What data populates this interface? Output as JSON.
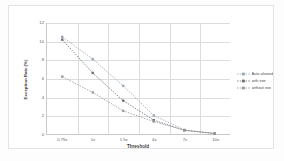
{
  "chart_data": {
    "type": "line",
    "title": "",
    "xlabel": "Threshold",
    "ylabel": "Exception Rate (%)",
    "categories": [
      "0.75x",
      "1x",
      "1.5x",
      "4x",
      "7x",
      "10x"
    ],
    "ylim": [
      0,
      12
    ],
    "yticks": [
      0,
      2,
      4,
      6,
      8,
      10,
      12
    ],
    "grid": true,
    "legend_position": "right",
    "series": [
      {
        "name": "Auto aligned",
        "color": "#9aa7b8",
        "marker": "square",
        "linestyle": "dotted",
        "values": [
          10.5,
          8.1,
          5.2,
          2.0,
          0.45,
          0.05
        ]
      },
      {
        "name": "with eye",
        "color": "#6f6f6f",
        "marker": "square",
        "linestyle": "dotted",
        "values": [
          10.2,
          6.6,
          3.6,
          1.5,
          0.4,
          0.05
        ]
      },
      {
        "name": "without eye",
        "color": "#9a9a9a",
        "marker": "square",
        "linestyle": "dotted",
        "values": [
          6.2,
          4.5,
          2.5,
          1.35,
          0.4,
          0.05
        ]
      }
    ]
  },
  "axes": {
    "y_tick_labels": [
      "12",
      "10",
      "8",
      "6",
      "4",
      "2",
      "0"
    ],
    "x_tick_labels": [
      "0.75x",
      "1x",
      "1.5x",
      "4x",
      "7x",
      "10x"
    ],
    "x_title": "Threshold",
    "y_title": "Exception Rate (%)"
  },
  "legend": {
    "items": [
      {
        "label": "Auto aligned",
        "color": "#9aa7b8"
      },
      {
        "label": "with eye",
        "color": "#6f6f6f"
      },
      {
        "label": "without eye",
        "color": "#9a9a9a"
      }
    ]
  },
  "colors": {
    "grid": "#dcdcdc",
    "axis": "#c9c9c9",
    "frame": "#e3e3e3",
    "text": "#5d5d5d",
    "background": "#ffffff"
  }
}
